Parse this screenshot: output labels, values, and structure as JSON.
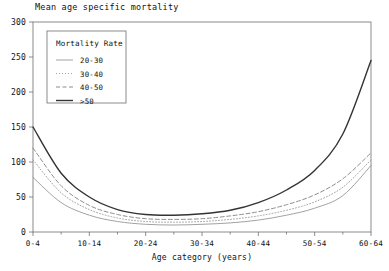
{
  "chart_data": {
    "type": "line",
    "title": "Mean age specific mortality",
    "xlabel": "Age category (years)",
    "ylabel": "",
    "ylim": [
      0,
      300
    ],
    "yticks": [
      0,
      50,
      100,
      150,
      200,
      250,
      300
    ],
    "ytick_labels": [
      "0",
      "50",
      "100",
      "150",
      "200",
      "250",
      "300"
    ],
    "grid": false,
    "legend_position": "upper-left-inside",
    "legend_title": "Mortality Rate",
    "categories": [
      "0-4",
      "5-9",
      "10-14",
      "15-19",
      "20-24",
      "25-29",
      "30-34",
      "35-39",
      "40-44",
      "45-49",
      "50-54",
      "55-59",
      "60-64"
    ],
    "xtick_labels": [
      "0-4",
      "",
      "10-14",
      "",
      "20-24",
      "",
      "30-34",
      "",
      "40-44",
      "",
      "50-54",
      "",
      "60-64"
    ],
    "series": [
      {
        "name": "20-30",
        "style": "solid-thin",
        "color": "#8a8a8a",
        "width": 0.8,
        "values": [
          78,
          42,
          24,
          15,
          11,
          10,
          11,
          13,
          17,
          24,
          34,
          52,
          95
        ]
      },
      {
        "name": "30-40",
        "style": "dotted",
        "color": "#9a9a9a",
        "width": 0.9,
        "values": [
          103,
          56,
          32,
          20,
          15,
          14,
          15,
          18,
          23,
          31,
          43,
          64,
          103
        ]
      },
      {
        "name": "40-50",
        "style": "dashed",
        "color": "#808080",
        "width": 0.9,
        "values": [
          120,
          66,
          38,
          25,
          19,
          18,
          19,
          23,
          29,
          39,
          53,
          76,
          113
        ]
      },
      {
        "name": ">50",
        "style": "solid-thick",
        "color": "#333333",
        "width": 1.4,
        "values": [
          150,
          84,
          50,
          32,
          25,
          24,
          26,
          31,
          42,
          60,
          88,
          140,
          245
        ]
      }
    ]
  }
}
